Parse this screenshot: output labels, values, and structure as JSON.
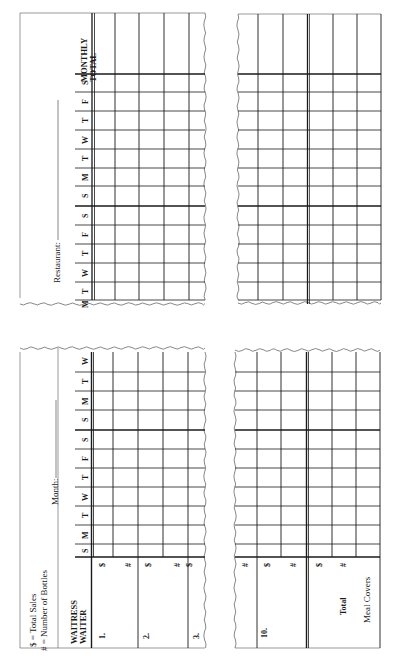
{
  "legend": {
    "dollar": "$ = Total Sales",
    "hash": "# = Number of Bottles"
  },
  "labels": {
    "month": "Month:",
    "restaurant": "Restaurant:",
    "monthly_total": [
      "MONTHLY",
      "TOTAL"
    ],
    "waitress": [
      "WAITRESS",
      "WAITER"
    ],
    "total": "Total",
    "meal_covers": "Meal Covers"
  },
  "days_top_panel": [
    "S",
    "F",
    "T",
    "W",
    "T",
    "M",
    "S",
    "S",
    "F",
    "T",
    "W",
    "T",
    "M"
  ],
  "days_bottom_panel": [
    "W",
    "T",
    "M",
    "S",
    "S",
    "F",
    "T",
    "W",
    "T",
    "M",
    "S"
  ],
  "waiters_left": [
    {
      "number": "1.",
      "rows": [
        "$",
        "#"
      ]
    },
    {
      "number": "2.",
      "rows": [
        "$",
        "#"
      ]
    },
    {
      "number": "3.",
      "rows": [
        "$"
      ]
    }
  ],
  "waiters_right": [
    {
      "number": "",
      "rows": [
        "#"
      ]
    },
    {
      "number": "10.",
      "rows": [
        "$",
        "#"
      ]
    },
    {
      "number": "Total",
      "rows": [
        "$",
        "#"
      ]
    },
    {
      "number": "Meal Covers",
      "rows": []
    }
  ],
  "colors": {
    "ink": "#1a1a1a",
    "paper": "#ffffff",
    "edge": "#555555"
  }
}
